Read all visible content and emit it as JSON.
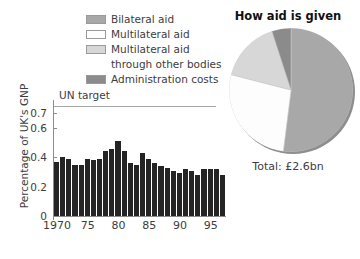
{
  "legend": {
    "items": [
      {
        "label": "Bilateral aid",
        "color": "#a8a8a8",
        "swatch": true
      },
      {
        "label": "Multilateral aid",
        "color": "#fdfdfd",
        "swatch": true
      },
      {
        "label": "Multilateral aid",
        "color": "#d7d7d7",
        "swatch": true
      },
      {
        "label": "through other bodies",
        "color": "",
        "swatch": false
      },
      {
        "label": "Administration costs",
        "color": "#8b8b8b",
        "swatch": true
      }
    ]
  },
  "bar_panel": {
    "un_target_label": "UN target"
  },
  "pie_panel": {
    "title": "How aid is given",
    "total": "Total: £2.6bn"
  },
  "chart_data": [
    {
      "type": "bar",
      "title": "",
      "xlabel": "",
      "ylabel": "Percentage of UK's GNP",
      "ylim": [
        0,
        0.75
      ],
      "yticks": [
        0,
        0.2,
        0.4,
        0.6,
        0.7
      ],
      "ytick_labels": [
        "0",
        "0.2",
        "0.4",
        "0.6",
        "0.7"
      ],
      "grid": false,
      "annotations": [
        {
          "text": "UN target",
          "y": 0.7,
          "type": "hline"
        }
      ],
      "xtick_positions": [
        1970,
        1975,
        1980,
        1985,
        1990,
        1995
      ],
      "xtick_labels": [
        "1970",
        "75",
        "80",
        "85",
        "90",
        "95"
      ],
      "categories": [
        "1970",
        "1971",
        "1972",
        "1973",
        "1974",
        "1975",
        "1976",
        "1977",
        "1978",
        "1979",
        "1980",
        "1981",
        "1982",
        "1983",
        "1984",
        "1985",
        "1986",
        "1987",
        "1988",
        "1989",
        "1990",
        "1991",
        "1992",
        "1993",
        "1994",
        "1995",
        "1996",
        "1997"
      ],
      "values": [
        0.37,
        0.4,
        0.39,
        0.35,
        0.35,
        0.39,
        0.38,
        0.39,
        0.44,
        0.46,
        0.51,
        0.44,
        0.36,
        0.35,
        0.43,
        0.39,
        0.36,
        0.34,
        0.33,
        0.31,
        0.29,
        0.32,
        0.31,
        0.28,
        0.32,
        0.32,
        0.32,
        0.28
      ]
    },
    {
      "type": "pie",
      "title": "How aid is given",
      "legend_position": "left",
      "labels": [
        "Bilateral aid",
        "Multilateral aid",
        "Multilateral aid through other bodies",
        "Administration costs"
      ],
      "values": [
        52,
        27,
        16,
        5
      ],
      "colors": [
        "#a8a8a8",
        "#fdfdfd",
        "#d7d7d7",
        "#8b8b8b"
      ],
      "total": "Total: £2.6bn"
    }
  ]
}
